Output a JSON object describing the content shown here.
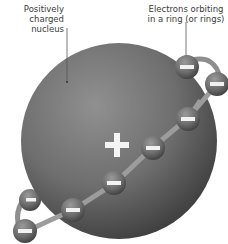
{
  "diagram": {
    "labels": {
      "nucleus": [
        "Positively",
        "charged",
        "nucleus"
      ],
      "electrons": [
        "Electrons orbiting",
        "in a ring (or rings)"
      ]
    },
    "nucleus": {
      "symbol": "+",
      "charge": "positive"
    },
    "electrons": {
      "symbol": "−",
      "count": 8
    },
    "colors": {
      "nucleus_light": "#8a8a8a",
      "nucleus_dark": "#3e3e3e",
      "electron": "#6a6a6a",
      "ring": "#9a9a9a",
      "text": "#3a3a3a",
      "leader_line": "#555555"
    }
  }
}
